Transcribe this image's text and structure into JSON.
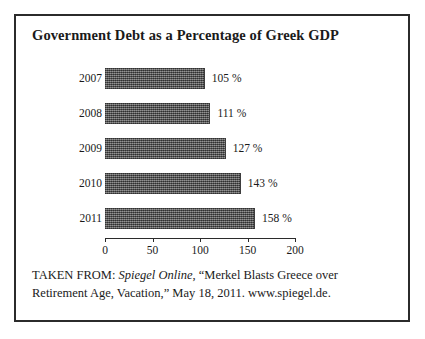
{
  "figure": {
    "title": "Government Debt as a Percentage of Greek GDP",
    "border_color": "#2b2b2b",
    "background": "#ffffff"
  },
  "source": {
    "prefix": "TAKEN FROM: ",
    "publication": "Spiegel Online",
    "rest": ", “Merkel Blasts Greece over Retirement Age, Vacation,” May 18, 2011. www.spiegel.de."
  },
  "chart_data": {
    "type": "bar",
    "orientation": "horizontal",
    "title": "Government Debt as a Percentage of Greek GDP",
    "xlabel": "",
    "ylabel": "",
    "categories": [
      "2007",
      "2008",
      "2009",
      "2010",
      "2011"
    ],
    "values": [
      105,
      111,
      127,
      143,
      158
    ],
    "value_labels": [
      "105 %",
      "111 %",
      "127 %",
      "143 %",
      "158 %"
    ],
    "xlim": [
      0,
      200
    ],
    "xticks": [
      0,
      50,
      100,
      150,
      200
    ],
    "xtick_labels": [
      "0",
      "50",
      "100",
      "150",
      "200"
    ],
    "grid": false,
    "legend": null,
    "bar_color": "#595959",
    "bar_texture": "halftone-dither"
  }
}
